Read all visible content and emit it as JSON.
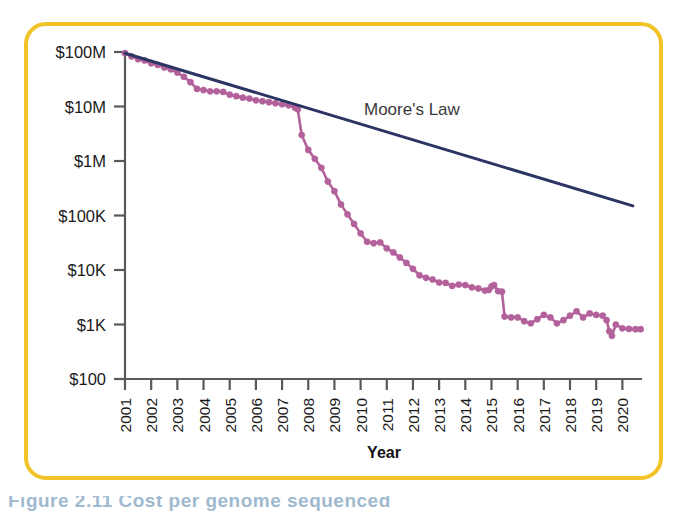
{
  "figure": {
    "border_color": "#f2c327",
    "background": "#ffffff"
  },
  "caption": {
    "text": "Figure 2.11  Cost per genome sequenced"
  },
  "chart_data": {
    "type": "line",
    "title": "",
    "xlabel": "Year",
    "ylabel": "",
    "grid": false,
    "legend_position": "inline-annotation",
    "yscale": "log",
    "ylim": [
      100,
      100000000
    ],
    "ytick_labels": [
      "$100M",
      "$10M",
      "$1M",
      "$100K",
      "$10K",
      "$1K",
      "$100"
    ],
    "ytick_values": [
      100000000,
      10000000,
      1000000,
      100000,
      10000,
      1000,
      100
    ],
    "xlim": [
      2001,
      2020.75
    ],
    "categories": [
      "2001",
      "2002",
      "2003",
      "2004",
      "2005",
      "2006",
      "2007",
      "2008",
      "2009",
      "2010",
      "2011",
      "2012",
      "2013",
      "2014",
      "2015",
      "2016",
      "2017",
      "2018",
      "2019",
      "2020"
    ],
    "series": [
      {
        "name": "Cost per genome",
        "color": "#b3619b",
        "marker": "circle",
        "annotation": "",
        "points": [
          {
            "x": 2001.0,
            "y": 95000000
          },
          {
            "x": 2001.25,
            "y": 83000000
          },
          {
            "x": 2001.5,
            "y": 74000000
          },
          {
            "x": 2001.75,
            "y": 70000000
          },
          {
            "x": 2002.0,
            "y": 62000000
          },
          {
            "x": 2002.25,
            "y": 58000000
          },
          {
            "x": 2002.5,
            "y": 52000000
          },
          {
            "x": 2002.75,
            "y": 48000000
          },
          {
            "x": 2003.0,
            "y": 42000000
          },
          {
            "x": 2003.25,
            "y": 35000000
          },
          {
            "x": 2003.5,
            "y": 28000000
          },
          {
            "x": 2003.75,
            "y": 21000000
          },
          {
            "x": 2004.0,
            "y": 20000000
          },
          {
            "x": 2004.25,
            "y": 19000000
          },
          {
            "x": 2004.5,
            "y": 19000000
          },
          {
            "x": 2004.75,
            "y": 18500000
          },
          {
            "x": 2005.0,
            "y": 16500000
          },
          {
            "x": 2005.25,
            "y": 15500000
          },
          {
            "x": 2005.5,
            "y": 14500000
          },
          {
            "x": 2005.75,
            "y": 14000000
          },
          {
            "x": 2006.0,
            "y": 13000000
          },
          {
            "x": 2006.25,
            "y": 12500000
          },
          {
            "x": 2006.5,
            "y": 12000000
          },
          {
            "x": 2006.75,
            "y": 11500000
          },
          {
            "x": 2007.0,
            "y": 11000000
          },
          {
            "x": 2007.25,
            "y": 10500000
          },
          {
            "x": 2007.5,
            "y": 9500000
          },
          {
            "x": 2007.6,
            "y": 8900000
          },
          {
            "x": 2007.75,
            "y": 3000000
          },
          {
            "x": 2008.0,
            "y": 1600000
          },
          {
            "x": 2008.25,
            "y": 1100000
          },
          {
            "x": 2008.5,
            "y": 750000
          },
          {
            "x": 2008.75,
            "y": 420000
          },
          {
            "x": 2009.0,
            "y": 280000
          },
          {
            "x": 2009.25,
            "y": 160000
          },
          {
            "x": 2009.5,
            "y": 105000
          },
          {
            "x": 2009.75,
            "y": 70000
          },
          {
            "x": 2010.0,
            "y": 47000
          },
          {
            "x": 2010.25,
            "y": 33000
          },
          {
            "x": 2010.5,
            "y": 31000
          },
          {
            "x": 2010.75,
            "y": 32000
          },
          {
            "x": 2011.0,
            "y": 25000
          },
          {
            "x": 2011.25,
            "y": 21000
          },
          {
            "x": 2011.5,
            "y": 17000
          },
          {
            "x": 2011.75,
            "y": 13500
          },
          {
            "x": 2012.0,
            "y": 10500
          },
          {
            "x": 2012.25,
            "y": 8000
          },
          {
            "x": 2012.5,
            "y": 7200
          },
          {
            "x": 2012.75,
            "y": 6700
          },
          {
            "x": 2013.0,
            "y": 5900
          },
          {
            "x": 2013.25,
            "y": 5800
          },
          {
            "x": 2013.5,
            "y": 5100
          },
          {
            "x": 2013.75,
            "y": 5400
          },
          {
            "x": 2014.0,
            "y": 5300
          },
          {
            "x": 2014.25,
            "y": 4800
          },
          {
            "x": 2014.5,
            "y": 4600
          },
          {
            "x": 2014.75,
            "y": 4200
          },
          {
            "x": 2014.9,
            "y": 4300
          },
          {
            "x": 2015.0,
            "y": 5000
          },
          {
            "x": 2015.1,
            "y": 5300
          },
          {
            "x": 2015.25,
            "y": 4100
          },
          {
            "x": 2015.4,
            "y": 4000
          },
          {
            "x": 2015.5,
            "y": 1400
          },
          {
            "x": 2015.75,
            "y": 1350
          },
          {
            "x": 2016.0,
            "y": 1350
          },
          {
            "x": 2016.25,
            "y": 1150
          },
          {
            "x": 2016.5,
            "y": 1050
          },
          {
            "x": 2016.75,
            "y": 1250
          },
          {
            "x": 2017.0,
            "y": 1500
          },
          {
            "x": 2017.25,
            "y": 1350
          },
          {
            "x": 2017.5,
            "y": 1050
          },
          {
            "x": 2017.75,
            "y": 1200
          },
          {
            "x": 2018.0,
            "y": 1450
          },
          {
            "x": 2018.25,
            "y": 1750
          },
          {
            "x": 2018.5,
            "y": 1350
          },
          {
            "x": 2018.75,
            "y": 1600
          },
          {
            "x": 2019.0,
            "y": 1500
          },
          {
            "x": 2019.25,
            "y": 1450
          },
          {
            "x": 2019.4,
            "y": 1200
          },
          {
            "x": 2019.5,
            "y": 750
          },
          {
            "x": 2019.6,
            "y": 620
          },
          {
            "x": 2019.75,
            "y": 1000
          },
          {
            "x": 2020.0,
            "y": 850
          },
          {
            "x": 2020.25,
            "y": 830
          },
          {
            "x": 2020.5,
            "y": 820
          },
          {
            "x": 2020.7,
            "y": 820
          }
        ]
      },
      {
        "name": "Moore's Law",
        "color": "#2b3563",
        "marker": "none",
        "annotation": "Moore's Law",
        "points": [
          {
            "x": 2001.0,
            "y": 95000000
          },
          {
            "x": 2020.4,
            "y": 150000
          }
        ]
      }
    ]
  }
}
